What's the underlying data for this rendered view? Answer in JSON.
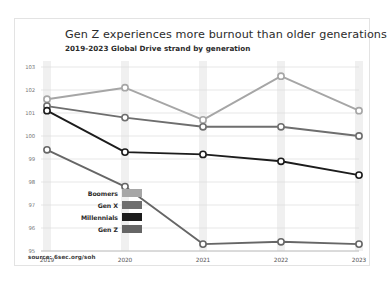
{
  "card": {
    "title": "Gen Z experiences more burnout than older generations",
    "subtitle": "2019-2023 Global Drive strand by generation",
    "source": "source: 6sec.org/soh"
  },
  "chart_data": {
    "type": "line",
    "title": "Gen Z experiences more burnout than older generations",
    "subtitle": "2019-2023 Global Drive strand by generation",
    "xlabel": "",
    "ylabel": "",
    "categories": [
      "2019",
      "2020",
      "2021",
      "2022",
      "2023"
    ],
    "x_tick_labels": [
      "2019",
      "2020",
      "2021",
      "2022",
      "2023"
    ],
    "y_tick_labels": [
      "103",
      "102",
      "101",
      "100",
      "99",
      "98",
      "97",
      "96",
      "95"
    ],
    "ylim": [
      95,
      103
    ],
    "grid": true,
    "legend_position": "inside-left-bottom",
    "series": [
      {
        "name": "Boomers",
        "color": "#a6a6a6",
        "values": [
          101.6,
          102.1,
          100.7,
          102.6,
          101.1
        ]
      },
      {
        "name": "Gen X",
        "color": "#6e6e6e",
        "values": [
          101.3,
          100.8,
          100.4,
          100.4,
          100.0
        ]
      },
      {
        "name": "Millennials",
        "color": "#1c1c1c",
        "values": [
          101.1,
          99.3,
          99.2,
          98.9,
          98.3
        ]
      },
      {
        "name": "Gen Z",
        "color": "#666666",
        "values": [
          99.4,
          97.8,
          95.3,
          95.4,
          95.3
        ]
      }
    ]
  }
}
